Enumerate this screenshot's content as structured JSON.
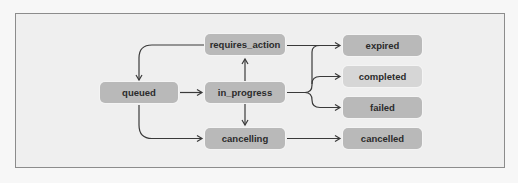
{
  "diagram": {
    "type": "state-machine",
    "colors": {
      "background": "#efefef",
      "frame_border": "#8c8c8c",
      "node_fill": "#b9b9b9",
      "node_fill_light": "#d6d6d6",
      "edge": "#3a3a3a"
    },
    "nodes": {
      "queued": {
        "label": "queued"
      },
      "requires_action": {
        "label": "requires_action"
      },
      "in_progress": {
        "label": "in_progress"
      },
      "cancelling": {
        "label": "cancelling"
      },
      "expired": {
        "label": "expired"
      },
      "completed": {
        "label": "completed"
      },
      "failed": {
        "label": "failed"
      },
      "cancelled": {
        "label": "cancelled"
      }
    },
    "edges": [
      {
        "from": "queued",
        "to": "in_progress"
      },
      {
        "from": "queued",
        "to": "cancelling"
      },
      {
        "from": "requires_action",
        "to": "queued"
      },
      {
        "from": "requires_action",
        "to": "expired"
      },
      {
        "from": "in_progress",
        "to": "requires_action"
      },
      {
        "from": "in_progress",
        "to": "cancelling"
      },
      {
        "from": "in_progress",
        "to": "expired"
      },
      {
        "from": "in_progress",
        "to": "completed"
      },
      {
        "from": "in_progress",
        "to": "failed"
      },
      {
        "from": "cancelling",
        "to": "cancelled"
      }
    ]
  }
}
